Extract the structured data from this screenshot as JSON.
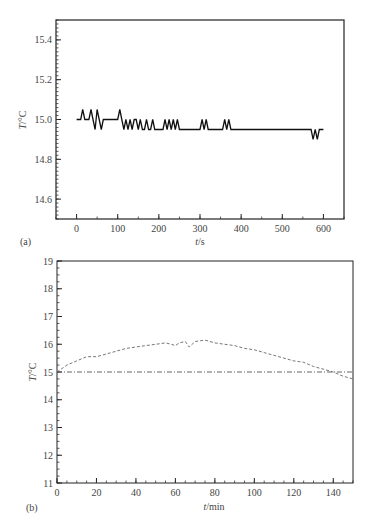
{
  "chart_data": [
    {
      "panel": "(a)",
      "type": "line",
      "title": "",
      "xlabel": "t/s",
      "ylabel": "T/°C",
      "xlim": [
        -50,
        650
      ],
      "ylim": [
        14.5,
        15.5
      ],
      "xticks": [
        "0",
        "100",
        "200",
        "300",
        "400",
        "500",
        "600"
      ],
      "yticks": [
        "14.6",
        "14.8",
        "15.0",
        "15.2",
        "15.4"
      ],
      "grid": false,
      "legend": null,
      "series": [
        {
          "name": "temperature",
          "x": [
            0,
            10,
            15,
            20,
            30,
            35,
            40,
            45,
            50,
            55,
            60,
            65,
            70,
            100,
            105,
            110,
            115,
            120,
            125,
            130,
            135,
            140,
            145,
            150,
            155,
            160,
            165,
            170,
            175,
            180,
            185,
            190,
            195,
            200,
            210,
            215,
            220,
            225,
            230,
            235,
            240,
            245,
            250,
            255,
            300,
            305,
            310,
            315,
            320,
            355,
            360,
            365,
            370,
            375,
            380,
            570,
            575,
            580,
            585,
            590,
            595,
            600
          ],
          "y": [
            15.0,
            15.0,
            15.05,
            15.0,
            15.0,
            15.05,
            15.0,
            14.95,
            15.05,
            15.0,
            14.95,
            15.0,
            15.0,
            15.0,
            15.05,
            15.0,
            14.95,
            15.0,
            14.95,
            15.0,
            14.95,
            15.0,
            15.0,
            14.95,
            15.0,
            14.95,
            14.95,
            15.0,
            14.95,
            14.95,
            15.0,
            14.95,
            14.95,
            14.95,
            14.95,
            15.0,
            14.95,
            15.0,
            14.95,
            15.0,
            14.95,
            15.0,
            14.95,
            14.95,
            14.95,
            15.0,
            14.95,
            15.0,
            14.95,
            14.95,
            15.0,
            14.95,
            15.0,
            14.95,
            14.95,
            14.95,
            14.9,
            14.95,
            14.9,
            14.95,
            14.95,
            14.95
          ]
        }
      ]
    },
    {
      "panel": "(b)",
      "type": "line",
      "title": "",
      "xlabel": "t/min",
      "ylabel": "T/°C",
      "xlim": [
        0,
        150
      ],
      "ylim": [
        11,
        19
      ],
      "xticks": [
        "0",
        "20",
        "40",
        "60",
        "80",
        "100",
        "120",
        "140"
      ],
      "yticks": [
        "11",
        "12",
        "13",
        "14",
        "15",
        "16",
        "17",
        "18",
        "19"
      ],
      "grid": false,
      "legend": null,
      "series": [
        {
          "name": "measured temperature (dashed)",
          "x": [
            0,
            5,
            10,
            15,
            20,
            25,
            30,
            35,
            40,
            45,
            50,
            55,
            58,
            60,
            62,
            65,
            67,
            70,
            75,
            80,
            85,
            90,
            95,
            100,
            105,
            110,
            115,
            120,
            125,
            130,
            135,
            140,
            145,
            150
          ],
          "y": [
            15.0,
            15.25,
            15.4,
            15.55,
            15.55,
            15.65,
            15.75,
            15.85,
            15.9,
            15.95,
            16.0,
            16.05,
            16.0,
            15.95,
            16.05,
            16.1,
            15.9,
            16.1,
            16.15,
            16.05,
            16.0,
            15.95,
            15.85,
            15.8,
            15.7,
            15.6,
            15.5,
            15.4,
            15.35,
            15.2,
            15.1,
            15.0,
            14.85,
            14.75
          ]
        },
        {
          "name": "set point (dash-dot)",
          "x": [
            0,
            150
          ],
          "y": [
            15.0,
            15.0
          ]
        }
      ]
    }
  ],
  "labels": {
    "a": {
      "panel": "(a)",
      "xlabel_var": "t",
      "xlabel_unit": "/s",
      "ylabel_var": "T",
      "ylabel_unit": "/°C",
      "xticks": [
        "0",
        "100",
        "200",
        "300",
        "400",
        "500",
        "600"
      ],
      "yticks": [
        "14.6",
        "14.8",
        "15.0",
        "15.2",
        "15.4"
      ]
    },
    "b": {
      "panel": "(b)",
      "xlabel_var": "t",
      "xlabel_unit": "/min",
      "ylabel_var": "T",
      "ylabel_unit": "/°C",
      "xticks": [
        "0",
        "20",
        "40",
        "60",
        "80",
        "100",
        "120",
        "140"
      ],
      "yticks": [
        "11",
        "12",
        "13",
        "14",
        "15",
        "16",
        "17",
        "18",
        "19"
      ]
    }
  }
}
